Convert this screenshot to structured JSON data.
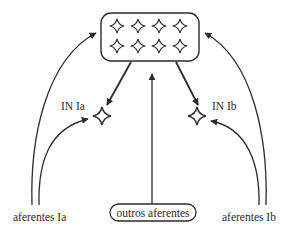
{
  "diagram": {
    "type": "neural-circuit",
    "motor_pool": {
      "label": "",
      "neuron_rows": 2,
      "neuron_cols": 4
    },
    "interneurons": [
      {
        "id": "in-ia",
        "label": "IN Ia"
      },
      {
        "id": "in-ib",
        "label": "IN Ib"
      }
    ],
    "inputs": [
      {
        "id": "aferentes-ia",
        "label": "aferentes Ia"
      },
      {
        "id": "outros-aferentes",
        "label": "outros aferentes"
      },
      {
        "id": "aferentes-ib",
        "label": "aferentes Ib"
      }
    ],
    "connections": [
      {
        "from": "aferentes Ia",
        "to": "motor pool"
      },
      {
        "from": "aferentes Ia",
        "to": "IN Ia"
      },
      {
        "from": "motor pool",
        "to": "IN Ia"
      },
      {
        "from": "motor pool",
        "to": "IN Ib"
      },
      {
        "from": "outros aferentes",
        "to": "motor pool"
      },
      {
        "from": "aferentes Ib",
        "to": "motor pool"
      },
      {
        "from": "aferentes Ib",
        "to": "IN Ib"
      }
    ],
    "colors": {
      "stroke": "#2b2b2b",
      "background": "#ffffff"
    }
  }
}
